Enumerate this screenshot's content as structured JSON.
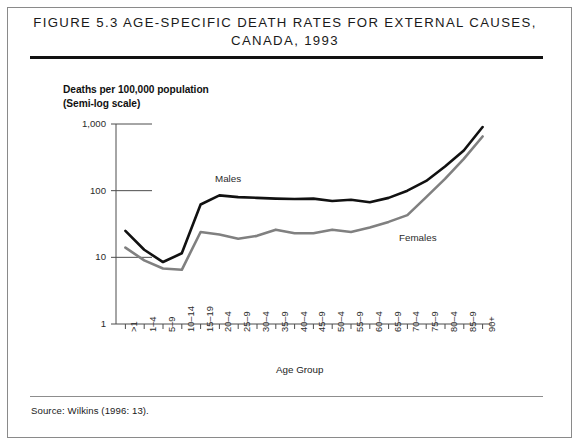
{
  "figure": {
    "title_line1": "Figure 5.3 Age-Specific Death Rates for External Causes,",
    "title_line2": "Canada, 1993",
    "source": "Source:  Wilkins (1996: 13)."
  },
  "colors": {
    "males_line": "#111111",
    "females_line": "#808080",
    "axis": "#4d4d4d",
    "frame": "#8a8a8a",
    "title_rule": "#111111",
    "text": "#1a1a1a"
  },
  "chart_data": {
    "type": "line",
    "title": "Figure 5.3 Age-Specific Death Rates for External Causes, Canada, 1993",
    "subtitle": "",
    "xlabel": "Age Group",
    "ylabel": "Deaths per 100,000 population\n(Semi-log scale)",
    "ylabel_line1": "Deaths per 100,000 population",
    "ylabel_line2": "(Semi-log scale)",
    "yscale": "log",
    "ylim": [
      1,
      1000
    ],
    "ytick_labels": [
      "1,000",
      "100",
      "10",
      "1"
    ],
    "ytick_values": [
      1000,
      100,
      10,
      1
    ],
    "grid": false,
    "legend_position": "inline-annotation",
    "categories": [
      ">1",
      "1–4",
      "5–9",
      "10–14",
      "15–19",
      "20–4",
      "25–9",
      "30–4",
      "35–9",
      "40–4",
      "45–9",
      "50–4",
      "55–9",
      "60–4",
      "65–9",
      "70–4",
      "75–9",
      "80–4",
      "85–9",
      "90+"
    ],
    "series": [
      {
        "name": "Males",
        "color": "#111111",
        "label_text": "Males",
        "values": [
          25,
          13,
          8.5,
          11.5,
          62,
          85,
          80,
          78,
          76,
          75,
          76,
          70,
          73,
          67,
          78,
          100,
          140,
          230,
          400,
          900
        ]
      },
      {
        "name": "Females",
        "color": "#808080",
        "label_text": "Females",
        "values": [
          14,
          9,
          6.8,
          6.5,
          24,
          22,
          19,
          21,
          26,
          23,
          23,
          26,
          24,
          28,
          34,
          43,
          80,
          150,
          300,
          650
        ]
      }
    ]
  }
}
